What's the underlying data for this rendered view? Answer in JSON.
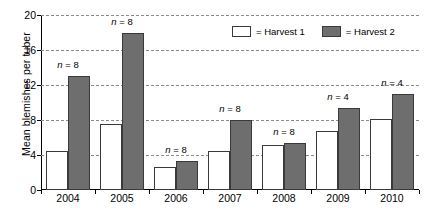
{
  "chart_data": {
    "type": "bar",
    "title": "",
    "xlabel": "",
    "ylabel": "Mean blemishes per tuber",
    "categories": [
      "2004",
      "2005",
      "2006",
      "2007",
      "2008",
      "2009",
      "2010"
    ],
    "series": [
      {
        "name": "Harvest 1",
        "color": "#ffffff",
        "values": [
          4.5,
          7.6,
          2.6,
          4.5,
          5.1,
          6.8,
          8.1
        ]
      },
      {
        "name": "Harvest 2",
        "color": "#6e6e6e",
        "values": [
          13.0,
          18.0,
          3.3,
          8.0,
          5.4,
          9.4,
          11.0
        ]
      }
    ],
    "annotations": [
      {
        "category": "2004",
        "text": "n = 8"
      },
      {
        "category": "2005",
        "text": "n = 8"
      },
      {
        "category": "2006",
        "text": "n = 8"
      },
      {
        "category": "2007",
        "text": "n = 8"
      },
      {
        "category": "2008",
        "text": "n = 8"
      },
      {
        "category": "2009",
        "text": "n = 4"
      },
      {
        "category": "2010",
        "text": "n = 4"
      }
    ],
    "ylim": [
      0,
      20
    ],
    "yticks": [
      0,
      4,
      8,
      12,
      16,
      20
    ],
    "ytick_labels": [
      "0",
      "4",
      "8",
      "12",
      "16",
      "20"
    ],
    "grid": "horizontal-dashed",
    "legend_position": "top-right-inside",
    "legend": [
      {
        "label": "= Harvest 1",
        "swatch": "open"
      },
      {
        "label": "= Harvest 2",
        "swatch": "filled-gray"
      }
    ]
  }
}
